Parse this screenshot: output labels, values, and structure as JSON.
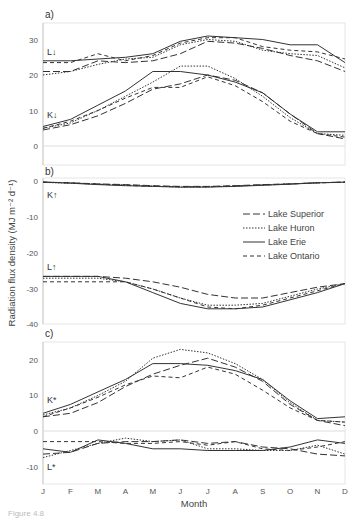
{
  "chart_data": [
    {
      "panel": "a)",
      "type": "line",
      "ylim": [
        -5,
        35
      ],
      "yticks": [
        0,
        10,
        20,
        30
      ],
      "x": [
        "J",
        "F",
        "M",
        "A",
        "M",
        "J",
        "J",
        "A",
        "S",
        "O",
        "N",
        "D"
      ],
      "annotations": [
        "L↓",
        "K↓"
      ],
      "series": [
        {
          "name": "Lake Superior",
          "group": "L↓",
          "values": [
            21,
            21,
            24,
            23.5,
            24,
            26,
            29.5,
            29,
            27.5,
            25.5,
            24,
            21
          ]
        },
        {
          "name": "Lake Huron",
          "group": "L↓",
          "values": [
            20,
            21,
            23,
            24.5,
            25,
            28.5,
            30,
            29.5,
            27,
            26,
            25.5,
            22
          ]
        },
        {
          "name": "Lake Erie",
          "group": "L↓",
          "values": [
            24,
            24,
            24.5,
            25,
            26,
            29.5,
            31,
            30.5,
            30,
            28.5,
            28.5,
            23.5
          ]
        },
        {
          "name": "Lake Ontario",
          "group": "L↓",
          "values": [
            23.5,
            23.5,
            26,
            24,
            25.5,
            29,
            30.5,
            30.5,
            28,
            27,
            26.5,
            24.5
          ]
        },
        {
          "name": "Lake Superior",
          "group": "K↓",
          "values": [
            4.5,
            6,
            8.5,
            12,
            16,
            17.5,
            20,
            18.5,
            15,
            9,
            3.5,
            2
          ]
        },
        {
          "name": "Lake Huron",
          "group": "K↓",
          "values": [
            5,
            6.5,
            10,
            14,
            18,
            22.5,
            22.5,
            19,
            14,
            8,
            3.5,
            3
          ]
        },
        {
          "name": "Lake Erie",
          "group": "K↓",
          "values": [
            5.5,
            7.5,
            11.5,
            15.5,
            21,
            21,
            20,
            18,
            15,
            9,
            4,
            4
          ]
        },
        {
          "name": "Lake Ontario",
          "group": "K↓",
          "values": [
            5,
            7,
            10,
            13.5,
            16.5,
            16.5,
            19.5,
            17,
            12.5,
            7,
            3.5,
            2.5
          ]
        }
      ]
    },
    {
      "panel": "b)",
      "type": "line",
      "ylim": [
        -40,
        0
      ],
      "yticks": [
        0,
        -10,
        -20,
        -30,
        -40
      ],
      "x": [
        "J",
        "F",
        "M",
        "A",
        "M",
        "J",
        "J",
        "A",
        "S",
        "O",
        "N",
        "D"
      ],
      "annotations": [
        "K↑",
        "L↑"
      ],
      "series": [
        {
          "name": "Lake Superior",
          "group": "K↑",
          "values": [
            -0.3,
            -0.5,
            -0.8,
            -1.0,
            -1.3,
            -1.5,
            -1.5,
            -1.3,
            -1.0,
            -0.8,
            -0.5,
            -0.3
          ]
        },
        {
          "name": "Lake Huron",
          "group": "K↑",
          "values": [
            -0.4,
            -0.6,
            -0.9,
            -1.1,
            -1.4,
            -1.7,
            -1.6,
            -1.4,
            -1.1,
            -0.8,
            -0.5,
            -0.4
          ]
        },
        {
          "name": "Lake Erie",
          "group": "K↑",
          "values": [
            -0.3,
            -0.6,
            -1.0,
            -1.3,
            -1.5,
            -1.7,
            -1.7,
            -1.5,
            -1.2,
            -0.9,
            -0.5,
            -0.3
          ]
        },
        {
          "name": "Lake Ontario",
          "group": "K↑",
          "values": [
            -0.3,
            -0.5,
            -0.9,
            -1.2,
            -1.5,
            -1.6,
            -1.6,
            -1.4,
            -1.1,
            -0.8,
            -0.5,
            -0.3
          ]
        },
        {
          "name": "Lake Superior",
          "group": "L↑",
          "values": [
            -26.5,
            -26.5,
            -26.5,
            -27,
            -28,
            -29.5,
            -31.5,
            -32.5,
            -32.5,
            -31,
            -29.5,
            -28.5
          ]
        },
        {
          "name": "Lake Huron",
          "group": "L↑",
          "values": [
            -27,
            -27,
            -27,
            -28,
            -30,
            -32.5,
            -34.5,
            -34.5,
            -34,
            -32,
            -30,
            -28.5
          ]
        },
        {
          "name": "Lake Erie",
          "group": "L↑",
          "values": [
            -26.5,
            -26.5,
            -26.5,
            -28,
            -31,
            -34,
            -35.5,
            -35.5,
            -35,
            -33,
            -31,
            -28.5
          ]
        },
        {
          "name": "Lake Ontario",
          "group": "L↑",
          "values": [
            -28,
            -28,
            -28,
            -28,
            -30,
            -32.5,
            -35,
            -35.5,
            -34.5,
            -32.5,
            -30.5,
            -28.5
          ]
        }
      ]
    },
    {
      "panel": "c)",
      "type": "line",
      "ylim": [
        -15,
        25
      ],
      "yticks": [
        20,
        10,
        0,
        -10
      ],
      "x": [
        "J",
        "F",
        "M",
        "A",
        "M",
        "J",
        "J",
        "A",
        "S",
        "O",
        "N",
        "D"
      ],
      "annotations": [
        "K*",
        "L*"
      ],
      "series": [
        {
          "name": "Lake Superior",
          "group": "K*",
          "values": [
            4,
            5,
            8,
            12.5,
            16,
            18.5,
            20.5,
            18,
            14,
            7.5,
            3,
            1.5
          ]
        },
        {
          "name": "Lake Huron",
          "group": "K*",
          "values": [
            4.5,
            6.5,
            10,
            14,
            20.5,
            23,
            22,
            19,
            14.5,
            8,
            3,
            2.5
          ]
        },
        {
          "name": "Lake Erie",
          "group": "K*",
          "values": [
            5,
            7.5,
            11,
            14.5,
            19,
            19,
            18.5,
            17,
            14.5,
            8.5,
            3.5,
            4
          ]
        },
        {
          "name": "Lake Ontario",
          "group": "K*",
          "values": [
            4,
            6.5,
            9.5,
            13,
            15.5,
            15,
            18,
            16,
            11.5,
            6.5,
            3,
            2.5
          ]
        },
        {
          "name": "Lake Superior",
          "group": "L*",
          "values": [
            -6.5,
            -6,
            -3.5,
            -3,
            -3,
            -2.5,
            -3.5,
            -3,
            -4.5,
            -5,
            -6.5,
            -7
          ]
        },
        {
          "name": "Lake Huron",
          "group": "L*",
          "values": [
            -7.5,
            -5.5,
            -3.5,
            -2,
            -3,
            -2.5,
            -5,
            -5,
            -5.5,
            -5.5,
            -4,
            -6.5
          ]
        },
        {
          "name": "Lake Erie",
          "group": "L*",
          "values": [
            -5,
            -6,
            -2.5,
            -3.5,
            -5,
            -5,
            -5.5,
            -5.5,
            -5.5,
            -4.5,
            -2.5,
            -3.5
          ]
        },
        {
          "name": "Lake Ontario",
          "group": "L*",
          "values": [
            -3,
            -3,
            -3,
            -3.5,
            -3.5,
            -3,
            -4,
            -3,
            -5,
            -5.5,
            -4.5,
            -3
          ]
        }
      ]
    }
  ],
  "axes": {
    "ylabel": "Radiation flux density (MJ m⁻² d⁻¹)",
    "xlabel": "Month",
    "months": [
      "J",
      "F",
      "M",
      "A",
      "M",
      "J",
      "J",
      "A",
      "S",
      "O",
      "N",
      "D"
    ]
  },
  "panels": {
    "a": {
      "label": "a)",
      "ticks": [
        "30",
        "20",
        "10",
        "0"
      ],
      "ann_top": "L↓",
      "ann_bot": "K↓"
    },
    "b": {
      "label": "b)",
      "ticks": [
        "0",
        "-10",
        "-20",
        "-30",
        "-40"
      ],
      "ann_top": "K↑",
      "ann_bot": "L↑"
    },
    "c": {
      "label": "c)",
      "ticks": [
        "20",
        "10",
        "0",
        "-10"
      ],
      "ann_top": "K*",
      "ann_bot": "L*"
    }
  },
  "legend": {
    "items": [
      {
        "label": "Lake Superior",
        "style": "long-dash"
      },
      {
        "label": "Lake Huron",
        "style": "dotted"
      },
      {
        "label": "Lake Erie",
        "style": "solid"
      },
      {
        "label": "Lake Ontario",
        "style": "short-dash"
      }
    ]
  },
  "caption": "Figure 4.8"
}
